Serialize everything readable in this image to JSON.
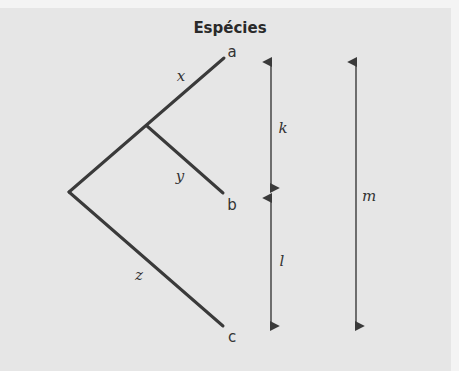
{
  "diagram": {
    "title": "Espécies",
    "colors": {
      "background": "#e6e6e6",
      "lines": "#3a3a3a"
    },
    "tips": [
      {
        "id": "a",
        "label": "a",
        "x": 224,
        "y": 58,
        "label_x": 232,
        "label_y": 57
      },
      {
        "id": "b",
        "label": "b",
        "x": 223,
        "y": 193,
        "label_x": 232,
        "label_y": 210
      },
      {
        "id": "c",
        "label": "c",
        "x": 223,
        "y": 326,
        "label_x": 232,
        "label_y": 342
      }
    ],
    "nodes": {
      "root": {
        "x": 69,
        "y": 192
      },
      "internal": {
        "x": 147,
        "y": 126
      }
    },
    "branch_labels": [
      {
        "label": "x",
        "x": 181,
        "y": 81
      },
      {
        "label": "y",
        "x": 180,
        "y": 181
      },
      {
        "label": "z",
        "x": 139,
        "y": 280
      }
    ],
    "distance_arrows": [
      {
        "label": "k",
        "x": 271,
        "y1": 60,
        "y2": 190,
        "label_x": 281,
        "label_y": 133
      },
      {
        "label": "l",
        "x": 271,
        "y1": 196,
        "y2": 328,
        "label_x": 281,
        "label_y": 266
      },
      {
        "label": "m",
        "x": 356,
        "y1": 60,
        "y2": 328,
        "label_x": 364,
        "label_y": 201
      }
    ]
  }
}
